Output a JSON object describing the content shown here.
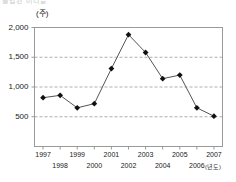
{
  "header": {
    "clipped_text": "클립된 머리글"
  },
  "chart_data": {
    "type": "line",
    "title": "",
    "xlabel": "(년도)",
    "ylabel": "(주)",
    "categories": [
      "1997",
      "1998",
      "1999",
      "2000",
      "2001",
      "2002",
      "2003",
      "2004",
      "2005",
      "2006",
      "2007"
    ],
    "values": [
      820,
      860,
      650,
      720,
      1310,
      1880,
      1580,
      1140,
      1200,
      650,
      510
    ],
    "series": [
      {
        "name": "주식수",
        "values": [
          820,
          860,
          650,
          720,
          1310,
          1880,
          1580,
          1140,
          1200,
          650,
          510
        ]
      }
    ],
    "ylim": [
      0,
      2000
    ],
    "yticks": [
      500,
      1000,
      1500,
      2000
    ],
    "ytick_labels": [
      "500",
      "1,000",
      "1,500",
      "2,000"
    ],
    "gridlines": [
      500,
      1000,
      1500
    ],
    "grid": true,
    "grid_style": "dashed-horizontal",
    "legend": "none",
    "marker": "diamond",
    "line_color": "#555555",
    "marker_color": "#111111",
    "grid_color": "#999999",
    "axis_color": "#9a9a9a"
  }
}
